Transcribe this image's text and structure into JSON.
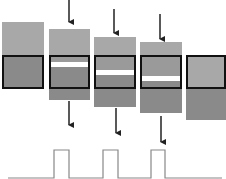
{
  "diagram": {
    "title": "",
    "colors": {
      "background": "#ffffff",
      "block_light": "#a8a8a8",
      "block_mid": "#9a9a9a",
      "block_dark": "#8a8a8a",
      "frame": "#111111",
      "white_band": "#ffffff",
      "arrow": "#222222",
      "pulse_line": "#888888"
    },
    "frame": {
      "y_top": 55,
      "y_bottom": 89
    },
    "blocks": [
      {
        "id": "block-1",
        "x": 2,
        "w": 42,
        "top": 22,
        "bottom": 89,
        "band": null,
        "in_frame": true
      },
      {
        "id": "block-2",
        "x": 49,
        "w": 41,
        "top": 29,
        "bottom": 100,
        "band": [
          62,
          67
        ]
      },
      {
        "id": "block-3",
        "x": 94,
        "w": 42,
        "top": 37,
        "bottom": 107,
        "band": [
          70,
          75
        ]
      },
      {
        "id": "block-4",
        "x": 140,
        "w": 42,
        "top": 42,
        "bottom": 113,
        "band": [
          76,
          81
        ]
      },
      {
        "id": "block-5",
        "x": 186,
        "w": 40,
        "top": 55,
        "bottom": 120,
        "band": null
      }
    ],
    "arrows_in": [
      {
        "x": 69,
        "y1": 0,
        "y2": 22
      },
      {
        "x": 114,
        "y1": 9,
        "y2": 33
      },
      {
        "x": 160,
        "y1": 14,
        "y2": 39
      }
    ],
    "arrows_out": [
      {
        "x": 69,
        "y1": 101,
        "y2": 125
      },
      {
        "x": 116,
        "y1": 108,
        "y2": 133
      },
      {
        "x": 161,
        "y1": 116,
        "y2": 142
      }
    ],
    "pulse_signal": {
      "baseline_y": 178,
      "high_y": 150,
      "x_start": 8,
      "x_end": 222,
      "pulses": [
        [
          54,
          69
        ],
        [
          103,
          118
        ],
        [
          151,
          165
        ]
      ]
    }
  }
}
